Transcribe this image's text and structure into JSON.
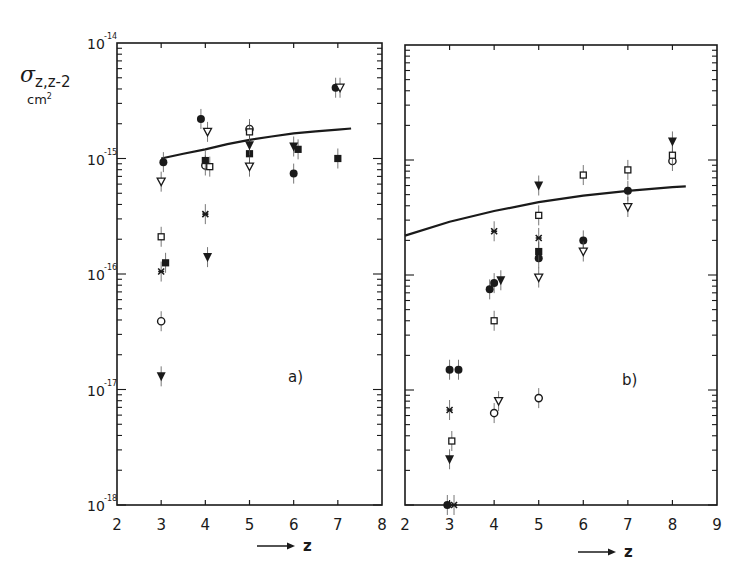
{
  "chart_data": [
    {
      "type": "scatter",
      "panel_label": "a)",
      "title": "",
      "xlabel": "z",
      "ylabel": "σ z,z-2",
      "yunit": "cm²",
      "xlim": [
        2,
        8
      ],
      "ylim": [
        1e-18,
        1e-14
      ],
      "yscale": "log",
      "xticks": [
        "2",
        "3",
        "4",
        "5",
        "6",
        "7",
        "8"
      ],
      "yticks": [
        "10^-14",
        "10^-15",
        "10^-16",
        "10^-17",
        "10^-18"
      ],
      "grid": false,
      "curve": {
        "name": "theory",
        "x": [
          3.0,
          3.5,
          4.0,
          4.5,
          5.0,
          5.5,
          6.0,
          6.5,
          7.0,
          7.3
        ],
        "y": [
          1e-15,
          1.1e-15,
          1.2e-15,
          1.33e-15,
          1.45e-15,
          1.55e-15,
          1.65e-15,
          1.72e-15,
          1.78e-15,
          1.82e-15
        ]
      },
      "series": [
        {
          "name": "filled-circle",
          "marker": "●",
          "points": [
            [
              3.05,
              9.3e-16
            ],
            [
              3.9,
              2.2e-15
            ],
            [
              6.0,
              7.4e-16
            ],
            [
              6.95,
              4.1e-15
            ]
          ]
        },
        {
          "name": "open-circle",
          "marker": "○",
          "points": [
            [
              3.0,
              3.9e-17
            ],
            [
              4.0,
              8.7e-16
            ],
            [
              5.0,
              1.8e-15
            ]
          ]
        },
        {
          "name": "filled-square",
          "marker": "■",
          "points": [
            [
              3.1,
              1.25e-16
            ],
            [
              4.0,
              9.6e-16
            ],
            [
              5.0,
              1.1e-15
            ],
            [
              6.1,
              1.2e-15
            ],
            [
              7.0,
              1e-15
            ]
          ]
        },
        {
          "name": "open-square",
          "marker": "□",
          "points": [
            [
              3.0,
              2.1e-16
            ],
            [
              4.1,
              8.5e-16
            ],
            [
              5.0,
              1.7e-15
            ]
          ]
        },
        {
          "name": "cross",
          "marker": "✕",
          "points": [
            [
              3.0,
              1.05e-16
            ],
            [
              4.0,
              3.3e-16
            ]
          ]
        },
        {
          "name": "filled-triangle-down",
          "marker": "▼",
          "points": [
            [
              3.0,
              1.3e-17
            ],
            [
              4.05,
              1.4e-16
            ],
            [
              5.0,
              1.3e-15
            ],
            [
              6.0,
              1.27e-15
            ]
          ]
        },
        {
          "name": "open-triangle-down",
          "marker": "▽",
          "points": [
            [
              3.0,
              6.3e-16
            ],
            [
              4.05,
              1.7e-15
            ],
            [
              5.0,
              8.5e-16
            ],
            [
              7.05,
              4.1e-15
            ]
          ]
        }
      ]
    },
    {
      "type": "scatter",
      "panel_label": "b)",
      "title": "",
      "xlabel": "z",
      "ylabel": "σ z,z-2",
      "yunit": "cm²",
      "xlim": [
        2,
        9
      ],
      "ylim": [
        1e-18,
        1e-14
      ],
      "yscale": "log",
      "xticks": [
        "2",
        "3",
        "4",
        "5",
        "6",
        "7",
        "8",
        "9"
      ],
      "grid": false,
      "curve": {
        "name": "theory",
        "x": [
          2.0,
          3.0,
          4.0,
          5.0,
          6.0,
          7.0,
          8.0,
          8.3
        ],
        "y": [
          2.2e-16,
          2.9e-16,
          3.6e-16,
          4.3e-16,
          4.9e-16,
          5.4e-16,
          5.8e-16,
          5.9e-16
        ]
      },
      "series": [
        {
          "name": "filled-circle",
          "marker": "●",
          "points": [
            [
              3.0,
              1.5e-17
            ],
            [
              3.2,
              1.5e-17
            ],
            [
              3.9,
              7.5e-17
            ],
            [
              4.0,
              8.5e-17
            ],
            [
              5.0,
              1.4e-16
            ],
            [
              6.0,
              2e-16
            ],
            [
              7.0,
              5.4e-16
            ],
            [
              2.95,
              1e-18
            ]
          ]
        },
        {
          "name": "open-circle",
          "marker": "○",
          "points": [
            [
              4.0,
              6.3e-18
            ],
            [
              5.0,
              8.5e-18
            ],
            [
              8.0,
              9.8e-16
            ]
          ]
        },
        {
          "name": "filled-square",
          "marker": "■",
          "points": [
            [
              5.0,
              1.6e-16
            ]
          ]
        },
        {
          "name": "open-square",
          "marker": "□",
          "points": [
            [
              3.05,
              3.6e-18
            ],
            [
              4.0,
              4e-17
            ],
            [
              5.0,
              3.3e-16
            ],
            [
              6.0,
              7.4e-16
            ],
            [
              7.0,
              8.2e-16
            ],
            [
              8.0,
              1.1e-15
            ]
          ]
        },
        {
          "name": "cross",
          "marker": "✕",
          "points": [
            [
              3.0,
              6.7e-18
            ],
            [
              4.0,
              2.4e-16
            ],
            [
              5.0,
              2.1e-16
            ],
            [
              3.1,
              1e-18
            ]
          ]
        },
        {
          "name": "filled-triangle-down",
          "marker": "▼",
          "points": [
            [
              3.0,
              2.5e-18
            ],
            [
              4.15,
              9e-17
            ],
            [
              5.0,
              6e-16
            ],
            [
              8.0,
              1.45e-15
            ]
          ]
        },
        {
          "name": "open-triangle-down",
          "marker": "▽",
          "points": [
            [
              4.1,
              8e-18
            ],
            [
              5.0,
              9.5e-17
            ],
            [
              6.0,
              1.6e-16
            ],
            [
              7.0,
              3.9e-16
            ]
          ]
        }
      ]
    }
  ],
  "labels": {
    "ylabel_symbol": "σ",
    "ylabel_sub": "z,z-2",
    "ylabel_unit": "cm",
    "ylabel_unit_exp": "2",
    "xlabel": "z",
    "panel_a": "a)",
    "panel_b": "b)"
  }
}
